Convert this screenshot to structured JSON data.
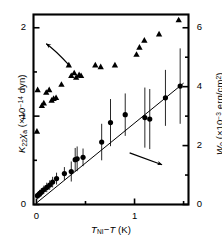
{
  "figure": {
    "background_color": "#ffffff",
    "frame_color": "#000000"
  },
  "chart_data": {
    "type": "scatter",
    "title": "",
    "xlabel": "T_NI−T (K)",
    "xlabel_parts": {
      "main": "T",
      "sub": "NI",
      "minus": "−",
      "var": "T",
      "unit": "(K)"
    },
    "ylabel_left": "K22χa (×10⁻¹⁴ dyn)",
    "ylabel_left_parts": {
      "sym": "K",
      "sub": "22",
      "chi": "χ",
      "chi_sub": "a",
      "unit_pre": "(×10",
      "unit_sup": "−14",
      "unit_post": " dyn)"
    },
    "ylabel_right": "W0 (×10⁻³ erg/cm²)",
    "ylabel_right_parts": {
      "sym": "W",
      "sub": "0",
      "unit_pre": "(×10",
      "unit_sup": "−3",
      "unit_post": " erg/cm",
      "unit_sup2": "2",
      "unit_close": ")"
    },
    "grid": false,
    "legend": "none",
    "annotations": [
      {
        "name": "arrow-to-left-axis",
        "text": "",
        "points_to": "left-axis",
        "from_x": 0.33,
        "from_y_left": 1.58,
        "to_x": 0.1,
        "to_y_left": 1.82
      },
      {
        "name": "arrow-to-right-axis",
        "text": "",
        "points_to": "right-axis",
        "from_x": 0.95,
        "from_y_right": 1.75,
        "to_x": 1.28,
        "to_y_right": 1.35
      }
    ],
    "axes": {
      "x": {
        "min": -0.03,
        "max": 1.55,
        "ticks": [
          0,
          1
        ],
        "tick_labels": [
          "0",
          "1"
        ],
        "minor_ticks": [
          0.5,
          1.5
        ]
      },
      "y_left": {
        "min": 0,
        "max": 2.15,
        "ticks": [
          0,
          1,
          2
        ],
        "tick_labels": [
          "0",
          "1",
          "2"
        ],
        "minor_ticks": [
          0.5,
          1.5
        ]
      },
      "y_right": {
        "min": 0,
        "max": 6.45,
        "ticks": [
          0,
          2,
          4,
          6
        ],
        "tick_labels": [
          "0",
          "2",
          "4",
          "6"
        ],
        "minor_ticks": [
          1,
          3,
          5
        ]
      }
    },
    "series": [
      {
        "name": "K22 chi_a",
        "marker": "triangle",
        "axis": "left",
        "color": "#000000",
        "points": [
          {
            "x": 0.005,
            "y": 0.83
          },
          {
            "x": 0.012,
            "y": 1.3
          },
          {
            "x": 0.055,
            "y": 1.12
          },
          {
            "x": 0.075,
            "y": 1.15
          },
          {
            "x": 0.1,
            "y": 1.27
          },
          {
            "x": 0.13,
            "y": 1.3
          },
          {
            "x": 0.155,
            "y": 1.18
          },
          {
            "x": 0.175,
            "y": 1.2
          },
          {
            "x": 0.2,
            "y": 1.21
          },
          {
            "x": 0.255,
            "y": 1.36
          },
          {
            "x": 0.33,
            "y": 1.58
          },
          {
            "x": 0.355,
            "y": 1.46
          },
          {
            "x": 0.385,
            "y": 1.49
          },
          {
            "x": 0.405,
            "y": 1.44
          },
          {
            "x": 0.435,
            "y": 1.47
          },
          {
            "x": 0.455,
            "y": 1.46
          },
          {
            "x": 0.6,
            "y": 1.58
          },
          {
            "x": 0.655,
            "y": 1.56
          },
          {
            "x": 0.8,
            "y": 1.58
          },
          {
            "x": 1.02,
            "y": 1.7
          },
          {
            "x": 1.05,
            "y": 1.78
          },
          {
            "x": 1.1,
            "y": 1.86
          },
          {
            "x": 1.25,
            "y": 1.93
          },
          {
            "x": 1.45,
            "y": 2.09
          }
        ]
      },
      {
        "name": "W0",
        "marker": "circle",
        "axis": "right",
        "color": "#000000",
        "has_error_bars": true,
        "fit_line": {
          "x0": 0.0,
          "y0": 0.05,
          "x1": 1.5,
          "y1": 4.12
        },
        "points": [
          {
            "x": 0.01,
            "y": 0.3,
            "err": 0.12
          },
          {
            "x": 0.022,
            "y": 0.33,
            "err": 0.12
          },
          {
            "x": 0.035,
            "y": 0.38,
            "err": 0.12
          },
          {
            "x": 0.05,
            "y": 0.42,
            "err": 0.14
          },
          {
            "x": 0.075,
            "y": 0.5,
            "err": 0.14
          },
          {
            "x": 0.105,
            "y": 0.58,
            "err": 0.16
          },
          {
            "x": 0.135,
            "y": 0.66,
            "err": 0.16
          },
          {
            "x": 0.165,
            "y": 0.76,
            "err": 0.18
          },
          {
            "x": 0.205,
            "y": 0.88,
            "err": 0.2
          },
          {
            "x": 0.285,
            "y": 1.05,
            "err": 0.22
          },
          {
            "x": 0.355,
            "y": 1.12,
            "err": 0.34
          },
          {
            "x": 0.395,
            "y": 1.52,
            "err": 0.4
          },
          {
            "x": 0.415,
            "y": 1.55,
            "err": 0.42
          },
          {
            "x": 0.475,
            "y": 1.6,
            "err": 0.3
          },
          {
            "x": 0.665,
            "y": 2.12,
            "err": 0.62
          },
          {
            "x": 0.755,
            "y": 2.78,
            "err": 0.8
          },
          {
            "x": 0.905,
            "y": 3.05,
            "err": 0.72
          },
          {
            "x": 1.105,
            "y": 2.95,
            "err": 1.02
          },
          {
            "x": 1.155,
            "y": 2.9,
            "err": 1.02
          },
          {
            "x": 1.315,
            "y": 3.62,
            "err": 0.95
          },
          {
            "x": 1.465,
            "y": 4.02,
            "err": 1.28
          }
        ]
      }
    ]
  }
}
